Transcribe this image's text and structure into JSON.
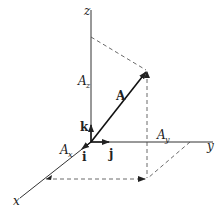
{
  "diagram": {
    "axes": {
      "x_label": "x",
      "y_label": "y",
      "z_label": "z"
    },
    "vector": {
      "label": "A"
    },
    "components": {
      "ax_main": "A",
      "ax_sub": "x",
      "ay_main": "A",
      "ay_sub": "y",
      "az_main": "A",
      "az_sub": "z"
    },
    "unit_vectors": {
      "i": "i",
      "j": "j",
      "k": "k"
    },
    "colors": {
      "line": "#222222",
      "dashed": "#444444",
      "background": "#ffffff"
    }
  }
}
